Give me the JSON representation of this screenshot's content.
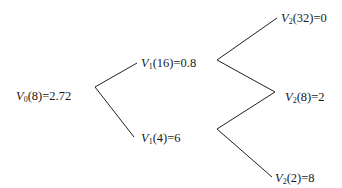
{
  "diagram": {
    "type": "binomial-tree",
    "nodes": [
      {
        "id": "v0",
        "symbol": "V",
        "sub": "0",
        "arg": "(8)",
        "value": "=2.72",
        "x": 16,
        "y": 89
      },
      {
        "id": "v1_up",
        "symbol": "V",
        "sub": "1",
        "arg": "(16)",
        "value": "=0.8",
        "x": 141,
        "y": 56
      },
      {
        "id": "v1_down",
        "symbol": "V",
        "sub": "1",
        "arg": "(4)",
        "value": "=6",
        "x": 141,
        "y": 131
      },
      {
        "id": "v2_uu",
        "symbol": "V",
        "sub": "2",
        "arg": "(32)",
        "value": "=0",
        "x": 281,
        "y": 11
      },
      {
        "id": "v2_ud",
        "symbol": "V",
        "sub": "2",
        "arg": "(8)",
        "value": "=2",
        "x": 285,
        "y": 90
      },
      {
        "id": "v2_dd",
        "symbol": "V",
        "sub": "2",
        "arg": "(2)",
        "value": "=8",
        "x": 275,
        "y": 171
      }
    ],
    "edges": [
      {
        "from": "v0",
        "to": "v1_up",
        "x1": 95,
        "y1": 87,
        "x2": 137,
        "y2": 63
      },
      {
        "from": "v0",
        "to": "v1_down",
        "x1": 95,
        "y1": 87,
        "x2": 134,
        "y2": 137
      },
      {
        "from": "v1_up",
        "to": "v2_uu",
        "x1": 217,
        "y1": 60,
        "x2": 277,
        "y2": 18
      },
      {
        "from": "v1_up",
        "to": "v2_ud",
        "x1": 217,
        "y1": 60,
        "x2": 275,
        "y2": 92
      },
      {
        "from": "v1_down",
        "to": "v2_ud",
        "x1": 217,
        "y1": 129,
        "x2": 275,
        "y2": 92
      },
      {
        "from": "v1_down",
        "to": "v2_dd",
        "x1": 217,
        "y1": 129,
        "x2": 272,
        "y2": 177
      }
    ],
    "colors": {
      "line": "#222222",
      "text": "#1a1a1a",
      "background": "#ffffff"
    }
  }
}
